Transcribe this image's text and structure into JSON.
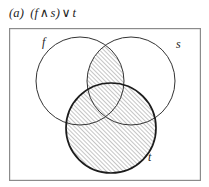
{
  "figure": {
    "label": "(a)",
    "caption_text": "(f ∧ s) ∨ t",
    "caption_parts": {
      "open_paren": "(",
      "left_operand": "f",
      "and_operator": "∧",
      "right_operand": "s",
      "close_paren": ")",
      "or_operator": "∨",
      "third_operand": "t"
    }
  },
  "diagram": {
    "type": "venn-3-set",
    "shaded_expression": "(f ∧ s) ∨ t",
    "sets": [
      {
        "id": "f",
        "label": "f",
        "label_x": 42,
        "label_y": 46,
        "cx": 80,
        "cy": 81,
        "r": 44,
        "stroke": "#333333",
        "stroke_width": 1.0
      },
      {
        "id": "s",
        "label": "s",
        "label_x": 176,
        "label_y": 48,
        "cx": 131,
        "cy": 81,
        "r": 44,
        "stroke": "#333333",
        "stroke_width": 1.0
      },
      {
        "id": "t",
        "label": "t",
        "label_x": 148,
        "label_y": 161,
        "cx": 111,
        "cy": 128,
        "r": 45,
        "stroke": "#1c1c1c",
        "stroke_width": 1.7
      }
    ],
    "shaded_regions": [
      {
        "name": "f-and-s",
        "description": "lens intersection of f and s"
      },
      {
        "name": "t",
        "description": "entire circle t"
      }
    ],
    "hatch": {
      "angle_label": "45deg-rising",
      "spacing_px": 3,
      "line_color": "#2b2b2b",
      "line_width": 0.55,
      "fill_color": "#ffffff"
    },
    "border": {
      "color": "#8b8b8b",
      "width": 1.2,
      "fill": "#ffffff"
    }
  }
}
